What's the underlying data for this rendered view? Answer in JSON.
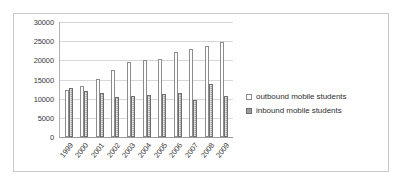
{
  "chart_data": {
    "type": "bar",
    "title": "",
    "xlabel": "",
    "ylabel": "",
    "ylim": [
      0,
      30000
    ],
    "ytick_values": [
      0,
      5000,
      10000,
      15000,
      20000,
      25000,
      30000
    ],
    "ytick_labels": [
      "0",
      "5000",
      "10000",
      "15000",
      "20000",
      "25000",
      "30000"
    ],
    "grid": true,
    "legend_position": "right",
    "categories": [
      "1999",
      "2000",
      "2001",
      "2002",
      "2003",
      "2004",
      "2005",
      "2006",
      "2007",
      "2008",
      "2009"
    ],
    "series": [
      {
        "name": "outbound mobile students",
        "color": "#ffffff",
        "border_color": "#8d8d8d",
        "values": [
          12200,
          13200,
          15200,
          17500,
          19500,
          20100,
          20400,
          22200,
          23000,
          23800,
          24800
        ]
      },
      {
        "name": "inbound mobile students",
        "color": "#9d9d9d",
        "border_color": "#6f6f6f",
        "values": [
          12900,
          12000,
          11600,
          10500,
          10700,
          10900,
          11100,
          11500,
          9700,
          13900,
          10600
        ]
      }
    ]
  },
  "legend": {
    "items": [
      {
        "label": "outbound mobile students",
        "marker": "hollow-square"
      },
      {
        "label": "inbound mobile students",
        "marker": "filled-square"
      }
    ]
  },
  "colors": {
    "frame_border": "#c9c9c9",
    "gridline": "#d7d7d7",
    "axis_line": "#9a9a9a",
    "text": "#3a3a3a"
  }
}
